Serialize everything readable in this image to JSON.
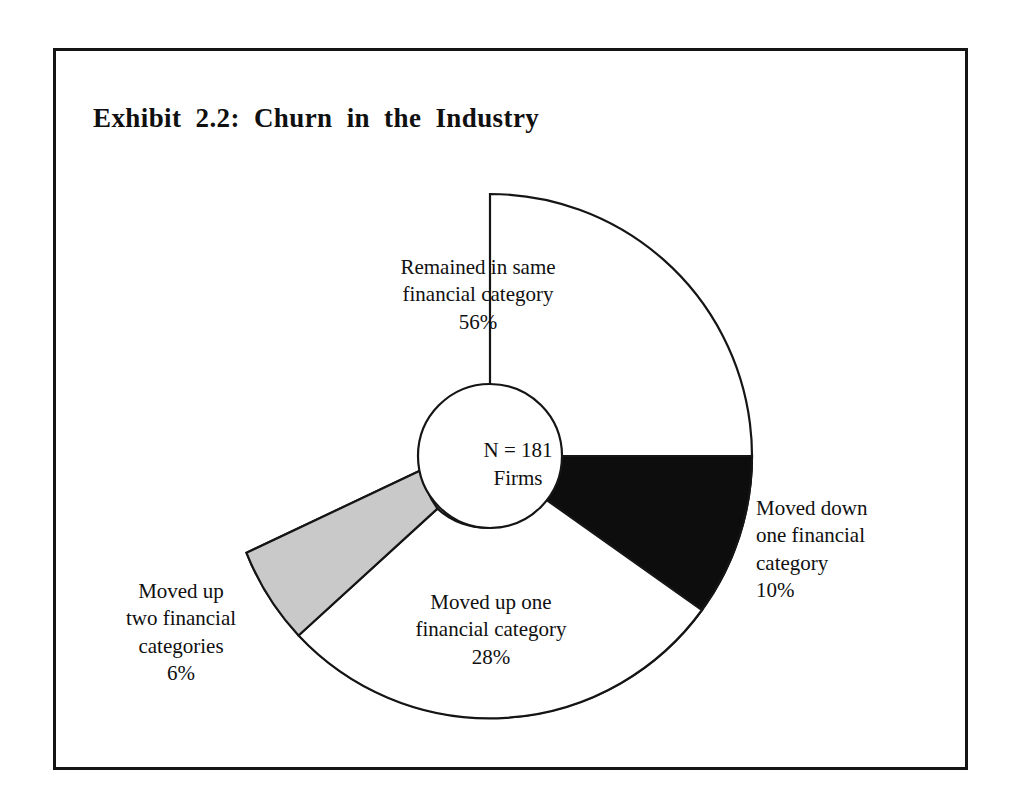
{
  "figure": {
    "title": "Exhibit 2.2:  Churn in the Industry",
    "frame_color": "#151515",
    "background_color": "#ffffff"
  },
  "center_annotation": {
    "line1": "N = 181",
    "line2": "Firms",
    "n_value": 181,
    "unit": "Firms"
  },
  "labels": {
    "remained": {
      "line1": "Remained in same",
      "line2": "financial category",
      "pct": "56%"
    },
    "moved_down_one": {
      "line1": "Moved down",
      "line2": "one financial",
      "line3": "category",
      "pct": "10%"
    },
    "moved_up_one": {
      "line1": "Moved up one",
      "line2": "financial category",
      "pct": "28%"
    },
    "moved_up_two": {
      "line1": "Moved up",
      "line2": "two financial",
      "line3": "categories",
      "pct": "6%"
    }
  },
  "chart_data": {
    "type": "pie",
    "title": "Exhibit 2.2:  Churn in the Industry",
    "subtitle": "",
    "xlabel": "",
    "ylabel": "",
    "donut": true,
    "inner_radius_ratio": 0.275,
    "start_angle_deg": 0,
    "direction": "clockwise",
    "total_n": 181,
    "total_label": "N = 181 Firms",
    "legend_position": "none",
    "grid": false,
    "categories": [
      "Moved down one financial category",
      "Moved up one financial category",
      "Moved up two financial categories",
      "Remained in same financial category"
    ],
    "values": [
      10,
      28,
      6,
      56
    ],
    "value_labels": [
      "10%",
      "28%",
      "6%",
      "56%"
    ],
    "units": "percent",
    "slices": [
      {
        "name": "Moved down one financial category",
        "value": 10,
        "label": "10%",
        "color": "#0d0d0d",
        "stroke": "#151515",
        "start_deg": 0.0,
        "end_deg": 36.0
      },
      {
        "name": "Moved up one financial category",
        "value": 28,
        "label": "28%",
        "color": "#ffffff",
        "stroke": "#151515",
        "start_deg": 36.0,
        "end_deg": 136.8
      },
      {
        "name": "Moved up two financial categories",
        "value": 6,
        "label": "6%",
        "color": "#c9c9c9",
        "stroke": "#151515",
        "start_deg": 136.8,
        "end_deg": 158.4
      },
      {
        "name": "Remained in same financial category",
        "value": 56,
        "label": "56%",
        "color": "#ffffff",
        "stroke": "#151515",
        "start_deg": 158.4,
        "end_deg": 360.0
      }
    ]
  },
  "colors": {
    "black_slice": "#0d0d0d",
    "gray_slice": "#c9c9c9",
    "white_slice": "#ffffff",
    "outline": "#151515",
    "text": "#101010"
  }
}
